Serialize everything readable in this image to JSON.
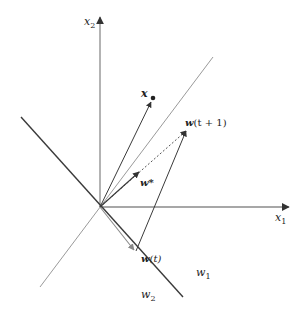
{
  "diagram": {
    "axes": {
      "x1": {
        "label": "x",
        "subscript": "1"
      },
      "x2": {
        "label": "x",
        "subscript": "2"
      }
    },
    "vectors": {
      "x": {
        "label": "x"
      },
      "w_star": {
        "label": "w*"
      },
      "w_t": {
        "label": "w",
        "suffix": "(t)"
      },
      "w_t1": {
        "label": "w",
        "suffix": "(t + 1)"
      }
    },
    "regions": {
      "w1": {
        "label": "w",
        "subscript": "1"
      },
      "w2": {
        "label": "w",
        "subscript": "2"
      }
    },
    "colors": {
      "axis": "#808080",
      "boundary": "#333333",
      "perpendicular": "#999999",
      "vector": "#333333"
    }
  }
}
